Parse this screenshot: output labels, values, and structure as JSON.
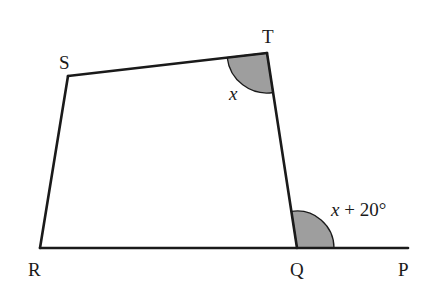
{
  "diagram": {
    "type": "quadrilateral-with-extended-side",
    "vertices": {
      "S": {
        "label": "S",
        "x": 68,
        "y": 76
      },
      "T": {
        "label": "T",
        "x": 267,
        "y": 53
      },
      "Q": {
        "label": "Q",
        "x": 297,
        "y": 248
      },
      "R": {
        "label": "R",
        "x": 40,
        "y": 248
      },
      "P": {
        "label": "P",
        "x": 408,
        "y": 248
      }
    },
    "angles": {
      "T": {
        "label_var": "x",
        "label_rest": "",
        "shaded": true,
        "color": "#9e9e9e"
      },
      "Q_exterior": {
        "label_var": "x",
        "label_rest": " + 20°",
        "shaded": true,
        "color": "#9e9e9e"
      }
    },
    "colors": {
      "line": "#1a1a1a",
      "shade": "#9e9e9e",
      "background": "#ffffff"
    }
  }
}
